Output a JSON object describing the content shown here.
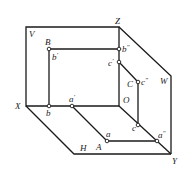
{
  "diagram": {
    "type": "three-plane-projection",
    "planes": {
      "V": {
        "label": "V"
      },
      "H": {
        "label": "H"
      },
      "W": {
        "label": "W"
      }
    },
    "axes": {
      "X": {
        "label": "X"
      },
      "Y": {
        "label": "Y"
      },
      "Z": {
        "label": "Z"
      },
      "O": {
        "label": "O"
      }
    },
    "points": {
      "A": {
        "label": "A",
        "h": "a",
        "v": "a",
        "w": "a",
        "v_mark": "'",
        "w_mark": "\""
      },
      "B": {
        "label": "B",
        "h": "b",
        "v": "b",
        "w": "b",
        "v_mark": "'",
        "w_mark": "\""
      },
      "C": {
        "label": "C",
        "h": "c",
        "v": "c",
        "w": "c",
        "v_mark": "'",
        "w_mark": "\""
      }
    },
    "colors": {
      "line": "#1a1a1a",
      "background": "#ffffff"
    }
  }
}
